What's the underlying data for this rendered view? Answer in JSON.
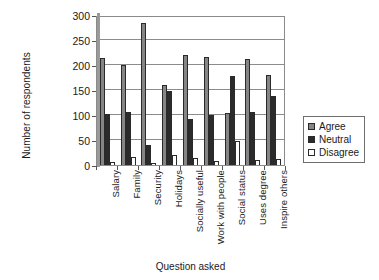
{
  "chart_data": {
    "type": "bar",
    "title": "",
    "xlabel": "Question asked",
    "ylabel": "Number of respondents",
    "ylim": [
      0,
      300
    ],
    "yticks": [
      0,
      50,
      100,
      150,
      200,
      250,
      300
    ],
    "ytick_labels": [
      "0",
      "50",
      "100",
      "150",
      "200",
      "250",
      "300"
    ],
    "grid": true,
    "legend_position": "right",
    "categories": [
      "Salary",
      "Family",
      "Security",
      "Holidays",
      "Socially useful",
      "Work with people",
      "Social status",
      "Uses degree",
      "Inspire others"
    ],
    "series": [
      {
        "name": "Agree",
        "color": "#858585",
        "values": [
          215,
          201,
          285,
          160,
          220,
          217,
          104,
          212,
          180
        ]
      },
      {
        "name": "Neutral",
        "color": "#2b2b2b",
        "values": [
          103,
          107,
          41,
          148,
          93,
          101,
          178,
          107,
          139
        ]
      },
      {
        "name": "Disagree",
        "color": "#ffffff",
        "values": [
          7,
          16,
          2,
          20,
          14,
          9,
          48,
          10,
          13
        ]
      }
    ]
  }
}
